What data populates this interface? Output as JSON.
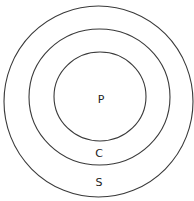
{
  "diagram": {
    "type": "concentric-circles",
    "circles": [
      {
        "id": "outer",
        "label": "S",
        "cx": 99,
        "cy": 101,
        "r": 94
      },
      {
        "id": "middle",
        "label": "C",
        "cx": 99,
        "cy": 97,
        "r": 69
      },
      {
        "id": "inner",
        "label": "P",
        "cx": 100,
        "cy": 97,
        "r": 46
      }
    ],
    "labels": {
      "inner": "P",
      "middle": "C",
      "outer": "S"
    },
    "stroke_color": "#3a3a3a",
    "background": "#ffffff"
  }
}
